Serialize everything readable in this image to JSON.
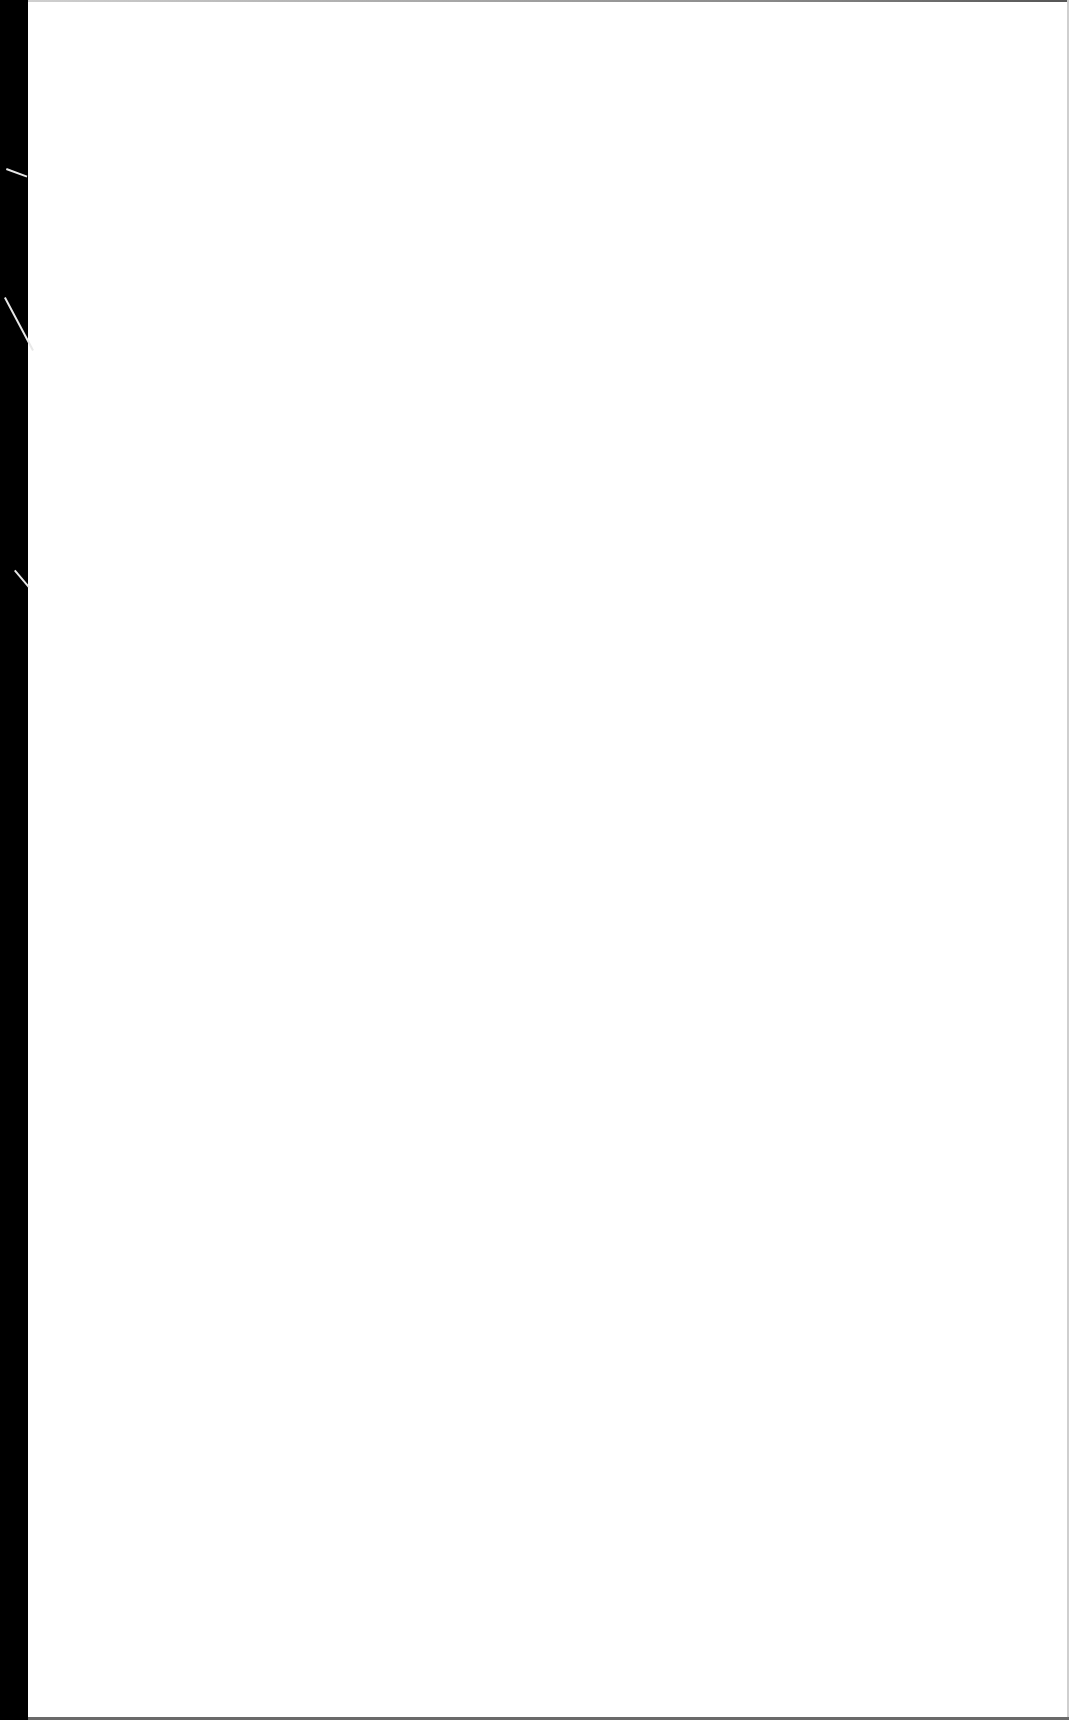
{
  "document": {
    "type": "scanned-blank-page",
    "text": "",
    "colors": {
      "paper": "#ffffff",
      "scan_margin": "#000000",
      "page_edge": "#6a6a6a"
    }
  }
}
